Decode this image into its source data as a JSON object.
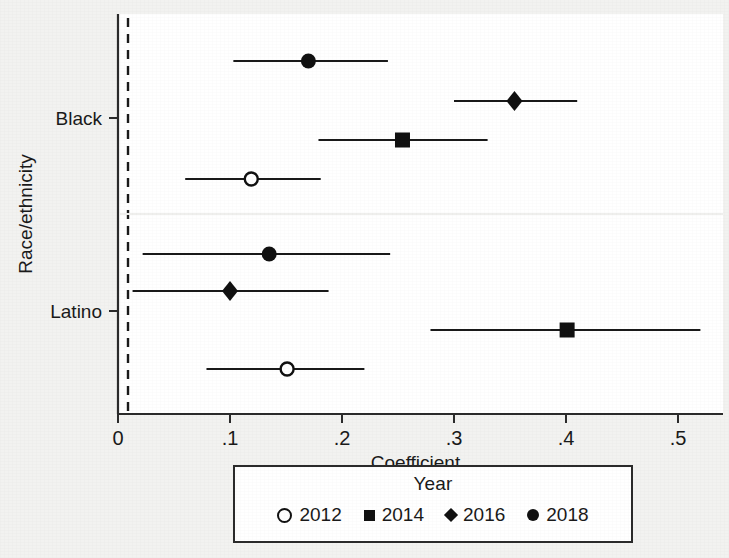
{
  "chart_data": {
    "type": "scatter",
    "subtype": "coefficient-plot-with-confidence-intervals",
    "title": "",
    "xlabel": "Coefficient",
    "ylabel": "Race/ethnicity",
    "xlim": [
      -0.015,
      0.545
    ],
    "xticks": [
      0,
      0.1,
      0.2,
      0.3,
      0.4,
      0.5
    ],
    "xticklabels": [
      "0",
      ".1",
      ".2",
      ".3",
      ".4",
      ".5"
    ],
    "ycategories": [
      "Black",
      "Latino"
    ],
    "grid": false,
    "reference_line": {
      "x": 0,
      "style": "dashed"
    },
    "legend": {
      "title": "Year",
      "position": "below-axes",
      "entries": [
        {
          "label": "2012",
          "marker": "open-circle"
        },
        {
          "label": "2014",
          "marker": "filled-square"
        },
        {
          "label": "2016",
          "marker": "filled-diamond"
        },
        {
          "label": "2018",
          "marker": "filled-circle"
        }
      ]
    },
    "series": [
      {
        "name": "2018",
        "marker": "filled-circle",
        "points": [
          {
            "group": "Black",
            "estimate": 0.17,
            "ci_low": 0.103,
            "ci_high": 0.241
          },
          {
            "group": "Latino",
            "estimate": 0.135,
            "ci_low": 0.022,
            "ci_high": 0.243
          }
        ]
      },
      {
        "name": "2016",
        "marker": "filled-diamond",
        "points": [
          {
            "group": "Black",
            "estimate": 0.354,
            "ci_low": 0.3,
            "ci_high": 0.41
          },
          {
            "group": "Latino",
            "estimate": 0.1,
            "ci_low": 0.013,
            "ci_high": 0.188
          }
        ]
      },
      {
        "name": "2014",
        "marker": "filled-square",
        "points": [
          {
            "group": "Black",
            "estimate": 0.254,
            "ci_low": 0.179,
            "ci_high": 0.33
          },
          {
            "group": "Latino",
            "estimate": 0.401,
            "ci_low": 0.279,
            "ci_high": 0.52
          }
        ]
      },
      {
        "name": "2012",
        "marker": "open-circle",
        "points": [
          {
            "group": "Black",
            "estimate": 0.119,
            "ci_low": 0.06,
            "ci_high": 0.181
          },
          {
            "group": "Latino",
            "estimate": 0.151,
            "ci_low": 0.079,
            "ci_high": 0.22
          }
        ]
      }
    ],
    "rows": [
      {
        "group": "Black",
        "year": "2018",
        "marker": "filled-circle",
        "estimate": 0.17,
        "ci_low": 0.103,
        "ci_high": 0.241,
        "y": 61
      },
      {
        "group": "Black",
        "year": "2016",
        "marker": "filled-diamond",
        "estimate": 0.354,
        "ci_low": 0.3,
        "ci_high": 0.41,
        "y": 101
      },
      {
        "group": "Black",
        "year": "2014",
        "marker": "filled-square",
        "estimate": 0.254,
        "ci_low": 0.179,
        "ci_high": 0.33,
        "y": 140
      },
      {
        "group": "Black",
        "year": "2012",
        "marker": "open-circle",
        "estimate": 0.119,
        "ci_low": 0.06,
        "ci_high": 0.181,
        "y": 179
      },
      {
        "group": "Latino",
        "year": "2018",
        "marker": "filled-circle",
        "estimate": 0.135,
        "ci_low": 0.022,
        "ci_high": 0.243,
        "y": 254
      },
      {
        "group": "Latino",
        "year": "2016",
        "marker": "filled-diamond",
        "estimate": 0.1,
        "ci_low": 0.013,
        "ci_high": 0.188,
        "y": 291
      },
      {
        "group": "Latino",
        "year": "2014",
        "marker": "filled-square",
        "estimate": 0.401,
        "ci_low": 0.279,
        "ci_high": 0.52,
        "y": 330
      },
      {
        "group": "Latino",
        "year": "2012",
        "marker": "open-circle",
        "estimate": 0.151,
        "ci_low": 0.079,
        "ci_high": 0.22,
        "y": 369
      }
    ],
    "category_positions": [
      {
        "label": "Black",
        "y": 118
      },
      {
        "label": "Latino",
        "y": 311
      }
    ],
    "colors": {
      "marker": "#111111",
      "line": "#1a1a1a",
      "axis": "#2b2b2b",
      "panel_background": "#ffffff",
      "figure_background": "#f2f2f0"
    }
  },
  "axis": {
    "x_title": "Coefficient",
    "y_title": "Race/ethnicity"
  },
  "legend": {
    "title": "Year"
  }
}
